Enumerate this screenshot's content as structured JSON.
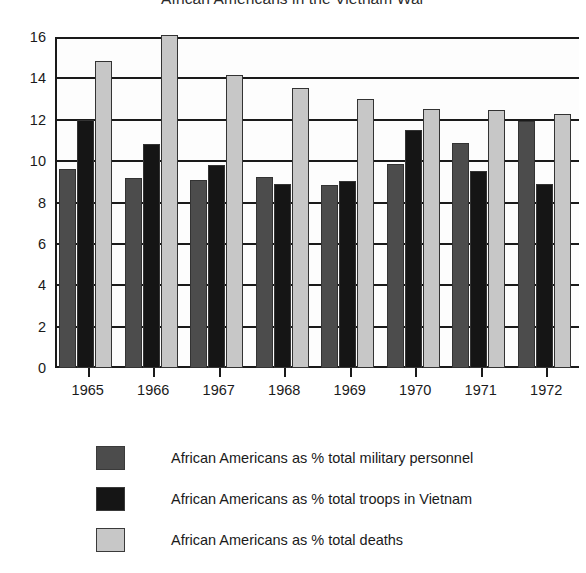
{
  "chart_data": {
    "type": "bar",
    "title": "African Americans in the Vietnam War",
    "xlabel": "",
    "ylabel": "",
    "ylim": [
      0,
      16
    ],
    "ytick_step": 2,
    "yticks": [
      "0",
      "2",
      "4",
      "6",
      "8",
      "10",
      "12",
      "14",
      "16"
    ],
    "grid": true,
    "legend_position": "below",
    "categories": [
      "1965",
      "1966",
      "1967",
      "1968",
      "1969",
      "1970",
      "1971",
      "1972"
    ],
    "series": [
      {
        "name": "African Americans as % total military personnel",
        "color": "#4c4c4c",
        "values": [
          9.6,
          9.2,
          9.1,
          9.25,
          8.85,
          9.85,
          10.9,
          11.95
        ]
      },
      {
        "name": "African Americans as % total troops in Vietnam",
        "color": "#151515",
        "values": [
          12.0,
          10.85,
          9.8,
          8.9,
          9.05,
          11.5,
          9.5,
          8.9
        ]
      },
      {
        "name": "African Americans as % total deaths",
        "color": "#c7c7c7",
        "values": [
          14.85,
          16.4,
          14.15,
          13.55,
          13.0,
          12.5,
          12.45,
          12.3
        ]
      }
    ]
  },
  "legend": {
    "items": [
      {
        "label": "African Americans as % total military personnel",
        "swatch": "#4c4c4c"
      },
      {
        "label": "African Americans as % total troops in Vietnam",
        "swatch": "#151515"
      },
      {
        "label": "African Americans as % total deaths",
        "swatch": "#c7c7c7"
      }
    ]
  }
}
